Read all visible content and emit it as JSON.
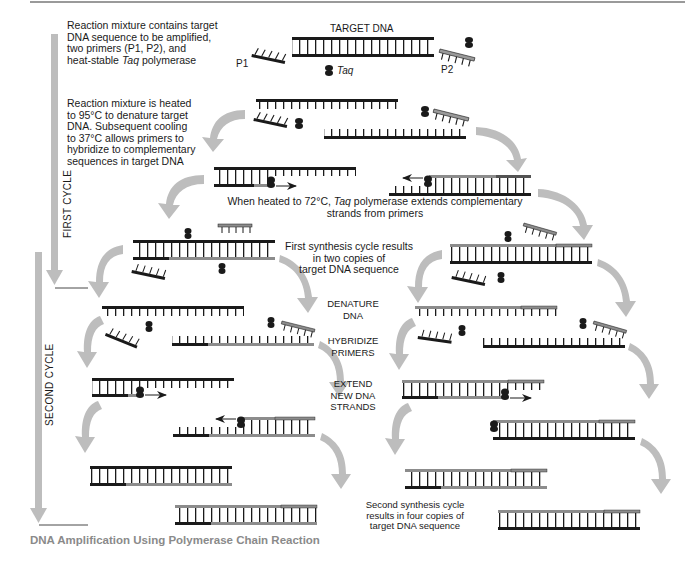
{
  "title": "DNA Amplification Using Polymerase Chain Reaction",
  "colors": {
    "dark_strand": "#1a1a1a",
    "new_strand": "#8c8c8c",
    "arrow_gray": "#bdbdbd",
    "caption_gray": "#8a8a8a"
  },
  "cycles": {
    "first": "FIRST CYCLE",
    "second": "SECOND CYCLE"
  },
  "labels": {
    "target_dna": "TARGET DNA",
    "p1": "P1",
    "p2": "P2",
    "taq": "Taq"
  },
  "steps": {
    "step1": {
      "line1": "Reaction mixture contains target",
      "line2": "DNA sequence to be amplified,",
      "line3": "two primers (P1, P2), and",
      "line4_pre": "heat-stable ",
      "line4_italic": "Taq",
      "line4_post": "  polymerase"
    },
    "step2": {
      "line1": "Reaction mixture is heated",
      "line2": "to 95°C to denature target",
      "line3": "DNA. Subsequent cooling",
      "line4": "to 37°C allows primers to",
      "line5": "hybridize to complementary",
      "line6": "sequences in target DNA"
    },
    "step3": {
      "line1_pre": "When heated to 72°C, ",
      "line1_italic": "Taq",
      "line1_post": "  polymerase extends complementary",
      "line2": "strands from primers"
    },
    "step4": {
      "line1": "First synthesis cycle results",
      "line2": "in two copies of",
      "line3": "target DNA sequence"
    },
    "phase_labels": {
      "denature_1": "DENATURE",
      "denature_2": "DNA",
      "hybridize_1": "HYBRIDIZE",
      "hybridize_2": "PRIMERS",
      "extend_1": "EXTEND",
      "extend_2": "NEW DNA",
      "extend_3": "STRANDS"
    },
    "step5": {
      "line1": "Second synthesis cycle",
      "line2": "results in four copies of",
      "line3": "target DNA sequence"
    }
  }
}
